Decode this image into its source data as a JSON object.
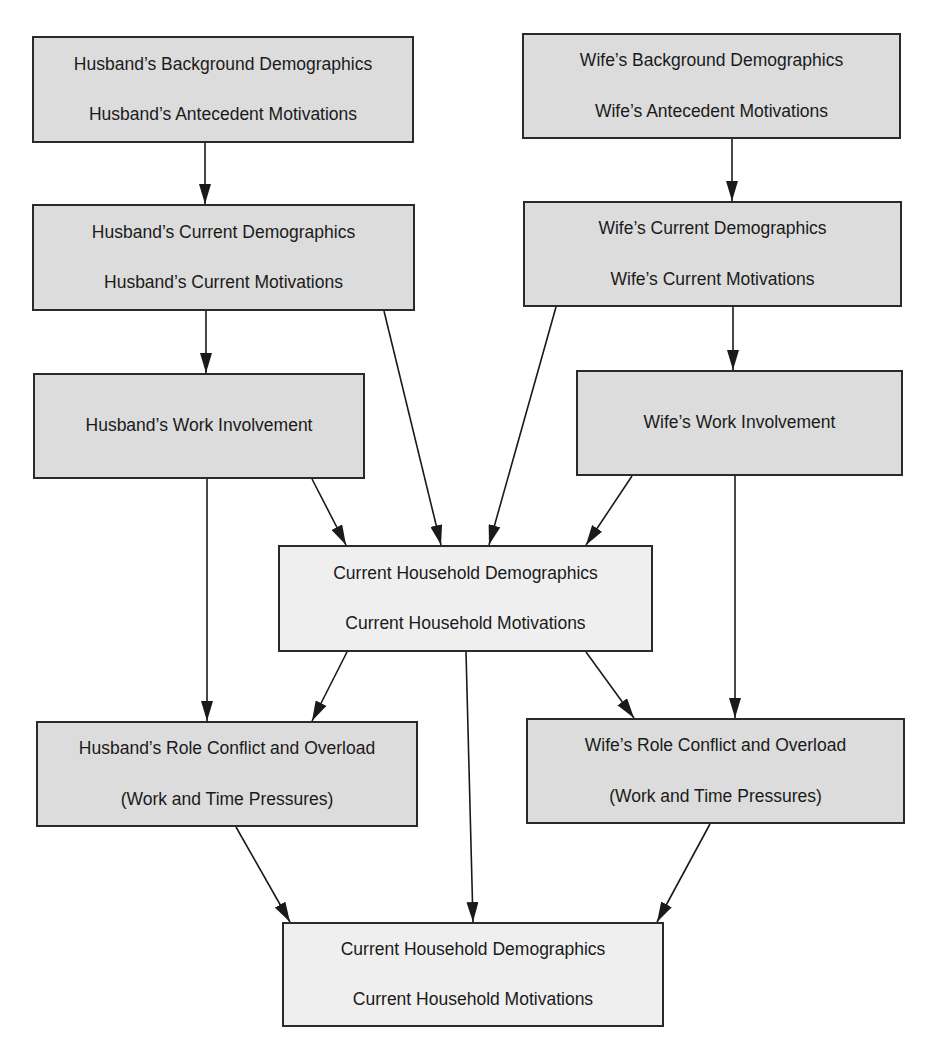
{
  "diagram": {
    "type": "flow",
    "nodes": [
      {
        "id": "husband_background",
        "lines": [
          "Husband’s Background Demographics",
          "Husband’s Antecedent Motivations"
        ],
        "fill": "#dcdcdc"
      },
      {
        "id": "wife_background",
        "lines": [
          "Wife’s Background Demographics",
          "Wife’s Antecedent Motivations"
        ],
        "fill": "#dcdcdc"
      },
      {
        "id": "husband_current",
        "lines": [
          "Husband’s Current Demographics",
          "Husband’s Current Motivations"
        ],
        "fill": "#dcdcdc"
      },
      {
        "id": "wife_current",
        "lines": [
          "Wife’s Current Demographics",
          "Wife’s Current Motivations"
        ],
        "fill": "#dcdcdc"
      },
      {
        "id": "husband_work",
        "lines": [
          "Husband’s Work Involvement"
        ],
        "fill": "#dcdcdc"
      },
      {
        "id": "wife_work",
        "lines": [
          "Wife’s Work Involvement"
        ],
        "fill": "#dcdcdc"
      },
      {
        "id": "household_current_1",
        "lines": [
          "Current Household Demographics",
          "Current Household Motivations"
        ],
        "fill": "#efefef"
      },
      {
        "id": "husband_role_conflict",
        "lines": [
          "Husband’s Role Conflict and Overload",
          "(Work and Time Pressures)"
        ],
        "fill": "#dcdcdc"
      },
      {
        "id": "wife_role_conflict",
        "lines": [
          "Wife’s Role Conflict and Overload",
          "(Work and Time Pressures)"
        ],
        "fill": "#dcdcdc"
      },
      {
        "id": "household_current_2",
        "lines": [
          "Current Household Demographics",
          "Current Household Motivations"
        ],
        "fill": "#efefef"
      }
    ],
    "edges": [
      {
        "from": "husband_background",
        "to": "husband_current"
      },
      {
        "from": "wife_background",
        "to": "wife_current"
      },
      {
        "from": "husband_current",
        "to": "husband_work"
      },
      {
        "from": "wife_current",
        "to": "wife_work"
      },
      {
        "from": "husband_current",
        "to": "household_current_1"
      },
      {
        "from": "wife_current",
        "to": "household_current_1"
      },
      {
        "from": "husband_work",
        "to": "household_current_1"
      },
      {
        "from": "wife_work",
        "to": "household_current_1"
      },
      {
        "from": "husband_work",
        "to": "husband_role_conflict"
      },
      {
        "from": "wife_work",
        "to": "wife_role_conflict"
      },
      {
        "from": "household_current_1",
        "to": "husband_role_conflict"
      },
      {
        "from": "household_current_1",
        "to": "wife_role_conflict"
      },
      {
        "from": "household_current_1",
        "to": "household_current_2"
      },
      {
        "from": "husband_role_conflict",
        "to": "household_current_2"
      },
      {
        "from": "wife_role_conflict",
        "to": "household_current_2"
      }
    ],
    "colors": {
      "stroke": "#2a2a2a",
      "dark_fill": "#dcdcdc",
      "light_fill": "#efefef",
      "text": "#1a1a1a"
    }
  }
}
